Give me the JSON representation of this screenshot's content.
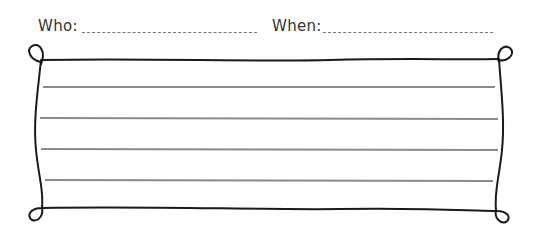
{
  "header": {
    "who_label": "Who:",
    "when_label": "When:"
  },
  "worksheet": {
    "line_count": 4,
    "frame_color": "#1a1a1a",
    "line_color": "#8a8a8a"
  }
}
